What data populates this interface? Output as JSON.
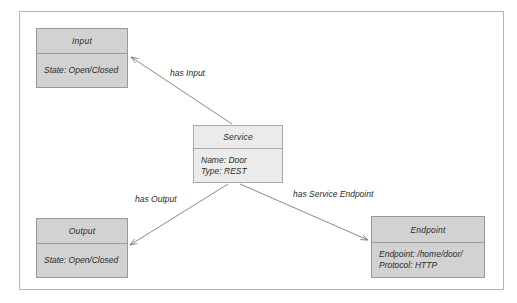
{
  "diagram": {
    "type": "uml-class-diagram",
    "title": "",
    "frame": {
      "border_color": "#b6b6b6",
      "background": "#ffffff"
    },
    "palette": {
      "box_fill": "#d2d2d2",
      "box_fill_light": "#ebebeb",
      "box_border": "#9a9a9a",
      "text_color": "#2b2b2b",
      "connector_color": "#7a7a7a"
    },
    "nodes": [
      {
        "id": "input",
        "name": "Input",
        "attributes": [
          "State: Open/Closed"
        ]
      },
      {
        "id": "service",
        "name": "Service",
        "attributes": [
          "Name: Door",
          "Type: REST"
        ]
      },
      {
        "id": "output",
        "name": "Output",
        "attributes": [
          "State: Open/Closed"
        ]
      },
      {
        "id": "endpoint",
        "name": "Endpoint",
        "attributes": [
          "Endpoint: /home/door/",
          "Protocol: HTTP"
        ]
      }
    ],
    "edges": [
      {
        "id": "has-input",
        "label": "has Input",
        "from": "service",
        "to": "input",
        "arrow": "open"
      },
      {
        "id": "has-output",
        "label": "has Output",
        "from": "service",
        "to": "output",
        "arrow": "open"
      },
      {
        "id": "has-service-endpoint",
        "label": "has Service Endpoint",
        "from": "service",
        "to": "endpoint",
        "arrow": "open"
      }
    ]
  }
}
